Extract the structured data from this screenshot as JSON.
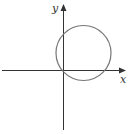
{
  "diagram": {
    "x_axis_label": "x",
    "y_axis_label": "y",
    "colors": {
      "axis": "#333333",
      "circle": "#777777",
      "background": "#ffffff"
    },
    "origin": {
      "x": 63,
      "y": 70
    },
    "circle": {
      "cx": 83.5,
      "cy": 53,
      "r": 27.5
    }
  }
}
